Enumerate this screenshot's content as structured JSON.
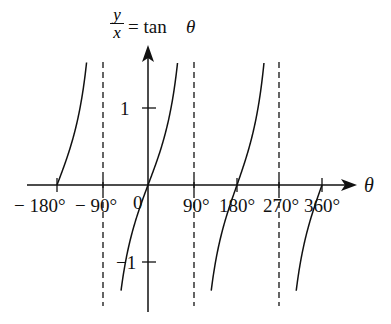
{
  "chart_data": {
    "type": "line",
    "ylabel_numerator": "y",
    "ylabel_denominator": "x",
    "ylabel_rhs": "= tan",
    "ylabel_theta": "θ",
    "xlabel": "θ",
    "x_ticks": [
      -180,
      -90,
      0,
      90,
      180,
      270,
      360
    ],
    "x_tick_labels": [
      "− 180°",
      "− 90°",
      "0",
      "90°",
      "180°",
      "270°",
      "360°"
    ],
    "y_ticks": [
      1,
      -1
    ],
    "y_tick_labels": [
      "1",
      "−1"
    ],
    "asymptotes": [
      -90,
      90,
      270
    ],
    "xlim": [
      -230,
      410
    ],
    "ylim": [
      -1.65,
      1.85
    ],
    "grid": false,
    "series": [
      {
        "name": "tan θ branch (−180° to −90°)",
        "x_range": [
          -180,
          -93
        ],
        "function": "tan"
      },
      {
        "name": "tan θ branch (−90° to 90°)",
        "x_range": [
          -67,
          87
        ],
        "function": "tan"
      },
      {
        "name": "tan θ branch (90° to 270°)",
        "x_range": [
          113,
          267
        ],
        "function": "tan"
      },
      {
        "name": "tan θ branch (270° to 360°)",
        "x_range": [
          293,
          360
        ],
        "function": "tan"
      }
    ],
    "colors": {
      "line": "#111111",
      "asymptote": "#111111"
    }
  }
}
